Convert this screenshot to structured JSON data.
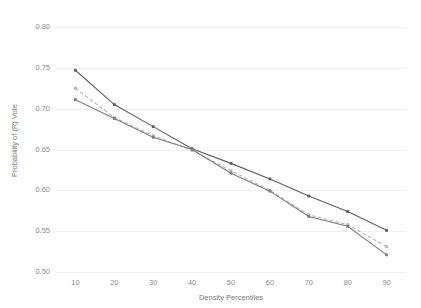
{
  "figure": {
    "clipped_top_text": "",
    "background_color": "#ffffff"
  },
  "chart_data": {
    "type": "line",
    "title": "",
    "xlabel": "Density Percentiles",
    "ylabel": "Probability of (R) Vote",
    "x": [
      10,
      20,
      30,
      40,
      50,
      60,
      70,
      80,
      90
    ],
    "xlim": [
      5,
      95
    ],
    "ylim": [
      0.5,
      0.8
    ],
    "ytick_labels": [
      "0.80",
      "0.75",
      "0.70",
      "0.65",
      "0.60",
      "0.55",
      "0.50"
    ],
    "ytick_values": [
      0.8,
      0.75,
      0.7,
      0.65,
      0.6,
      0.55,
      0.5
    ],
    "xtick_labels": [
      "10",
      "20",
      "30",
      "40",
      "50",
      "60",
      "70",
      "80",
      "90"
    ],
    "grid": "horizontal",
    "legend": "none",
    "series": [
      {
        "name": "series-1",
        "style": "solid",
        "color": "#5f5f5f",
        "marker": "square",
        "values": [
          0.747,
          0.705,
          0.678,
          0.651,
          0.633,
          0.614,
          0.593,
          0.574,
          0.551
        ]
      },
      {
        "name": "series-2",
        "style": "dashed",
        "color": "#b4b4b4",
        "marker": "square",
        "values": [
          0.725,
          0.689,
          0.667,
          0.649,
          0.624,
          0.6,
          0.57,
          0.558,
          0.531
        ]
      },
      {
        "name": "series-3",
        "style": "solid",
        "color": "#7d7d7d",
        "marker": "square",
        "values": [
          0.711,
          0.688,
          0.665,
          0.65,
          0.621,
          0.599,
          0.568,
          0.556,
          0.521
        ]
      }
    ]
  }
}
